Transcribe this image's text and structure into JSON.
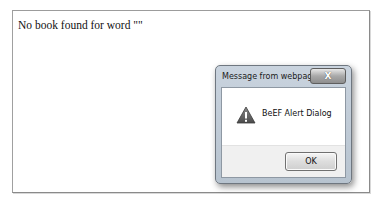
{
  "page": {
    "message": "No book found for word \"\""
  },
  "dialog": {
    "title": "Message from webpage",
    "close_label": "X",
    "icon": "warning-icon",
    "message": "BeEF Alert Dialog",
    "ok_label": "OK"
  }
}
